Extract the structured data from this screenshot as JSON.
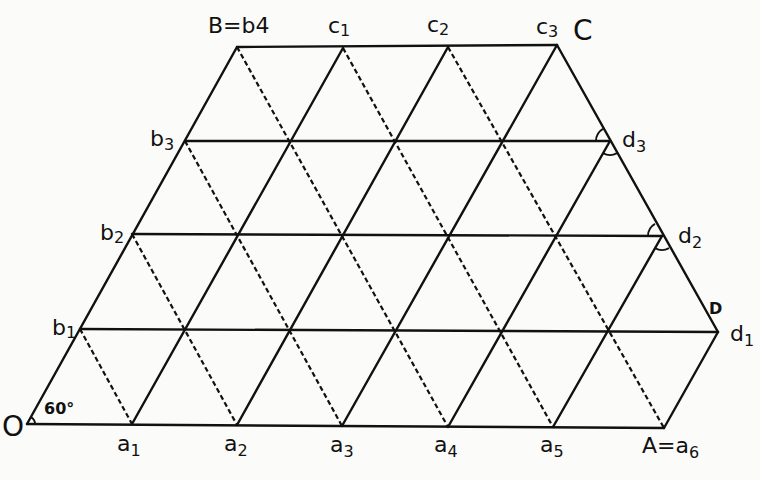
{
  "diagram": {
    "title": "",
    "points": {
      "O": {
        "x": 27,
        "y": 424,
        "label": "O"
      },
      "a1": {
        "x": 132,
        "y": 424,
        "label": "a",
        "sub": "1"
      },
      "a2": {
        "x": 237,
        "y": 425,
        "label": "a",
        "sub": "2"
      },
      "a3": {
        "x": 342,
        "y": 426,
        "label": "a",
        "sub": "3"
      },
      "a4": {
        "x": 448,
        "y": 427,
        "label": "a",
        "sub": "4"
      },
      "a5": {
        "x": 553,
        "y": 427,
        "label": "a",
        "sub": "5"
      },
      "A": {
        "x": 664,
        "y": 428,
        "label": "A=a",
        "sub": "6"
      },
      "b1": {
        "x": 80,
        "y": 329,
        "label": "b",
        "sub": "1"
      },
      "b2": {
        "x": 132,
        "y": 234,
        "label": "b",
        "sub": "2"
      },
      "b3": {
        "x": 185,
        "y": 141,
        "label": "b",
        "sub": "3"
      },
      "B": {
        "x": 237,
        "y": 47,
        "label": "B=b4"
      },
      "c1": {
        "x": 343,
        "y": 48,
        "label": "c",
        "sub": "1"
      },
      "c2": {
        "x": 448,
        "y": 47,
        "label": "c",
        "sub": "2"
      },
      "C": {
        "x": 557,
        "y": 45,
        "label": "c",
        "sub": "3",
        "extra": "C"
      },
      "d3": {
        "x": 610,
        "y": 141,
        "label": "d",
        "sub": "3"
      },
      "d2": {
        "x": 662,
        "y": 236,
        "label": "d",
        "sub": "2"
      },
      "d1": {
        "x": 718,
        "y": 332,
        "label": "d",
        "sub": "1",
        "extra": "D"
      }
    },
    "labels": {
      "O": "O",
      "a1": "a",
      "a1_sub": "1",
      "a2": "a",
      "a2_sub": "2",
      "a3": "a",
      "a3_sub": "3",
      "a4": "a",
      "a4_sub": "4",
      "a5": "a",
      "a5_sub": "5",
      "A": "A=a",
      "A_sub": "6",
      "b1": "b",
      "b1_sub": "1",
      "b2": "b",
      "b2_sub": "2",
      "b3": "b",
      "b3_sub": "3",
      "B": "B=b4",
      "c1": "c",
      "c1_sub": "1",
      "c2": "c",
      "c2_sub": "2",
      "c3": "c",
      "c3_sub": "3",
      "C": "C",
      "d3": "d",
      "d3_sub": "3",
      "d2": "d",
      "d2_sub": "2",
      "d1": "d",
      "d1_sub": "1",
      "D": "D",
      "angle": "60°"
    },
    "horizontal_lines": [
      [
        "O",
        "A"
      ],
      [
        "b1",
        "d1"
      ],
      [
        "b2",
        "d2"
      ],
      [
        "b3",
        "d3"
      ],
      [
        "B",
        "C"
      ]
    ],
    "solid_rising_lines": [
      [
        "O",
        "B"
      ],
      [
        "a1",
        "c1"
      ],
      [
        "a2",
        "c2"
      ],
      [
        "a3",
        "C"
      ],
      [
        "a4",
        "d3"
      ],
      [
        "a5",
        "d2"
      ],
      [
        "A",
        "d1"
      ]
    ],
    "solid_edges": [
      [
        "C",
        "d1"
      ]
    ],
    "dashed_falling_lines": [
      [
        "b1",
        "a1"
      ],
      [
        "b2",
        "a2"
      ],
      [
        "b3",
        "a3"
      ],
      [
        "B",
        "a4"
      ],
      [
        "c1",
        "a5"
      ],
      [
        "c2",
        "A"
      ]
    ],
    "angle_marks": [
      "d3-upper",
      "d3-lower",
      "d2-upper",
      "d2-lower"
    ]
  }
}
